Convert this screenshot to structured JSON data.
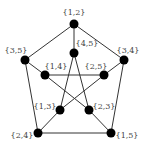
{
  "nodes": [
    {
      "id": "12",
      "label": "{1,2}",
      "x": 74,
      "y": 24,
      "lx": 74,
      "ly": 13,
      "anchor": "middle"
    },
    {
      "id": "35",
      "label": "{3,5}",
      "x": 25,
      "y": 60,
      "lx": 16,
      "ly": 51,
      "anchor": "middle"
    },
    {
      "id": "34",
      "label": "{3,4}",
      "x": 124,
      "y": 60,
      "lx": 128,
      "ly": 51,
      "anchor": "middle"
    },
    {
      "id": "45",
      "label": "{4,5}",
      "x": 74,
      "y": 53,
      "lx": 87,
      "ly": 44,
      "anchor": "middle"
    },
    {
      "id": "14",
      "label": "{1,4}",
      "x": 45,
      "y": 75,
      "lx": 56,
      "ly": 67,
      "anchor": "middle"
    },
    {
      "id": "25",
      "label": "{2,5}",
      "x": 104,
      "y": 75,
      "lx": 96,
      "ly": 67,
      "anchor": "middle"
    },
    {
      "id": "13",
      "label": "{1,3}",
      "x": 60,
      "y": 110,
      "lx": 45,
      "ly": 107,
      "anchor": "middle"
    },
    {
      "id": "23",
      "label": "{2,3}",
      "x": 89,
      "y": 110,
      "lx": 104,
      "ly": 107,
      "anchor": "middle"
    },
    {
      "id": "24",
      "label": "{2,4}",
      "x": 38,
      "y": 133,
      "lx": 22,
      "ly": 136,
      "anchor": "middle"
    },
    {
      "id": "15",
      "label": "{1,5}",
      "x": 111,
      "y": 133,
      "lx": 127,
      "ly": 136,
      "anchor": "middle"
    }
  ],
  "edges": [
    [
      "12",
      "35"
    ],
    [
      "12",
      "34"
    ],
    [
      "12",
      "45"
    ],
    [
      "35",
      "24"
    ],
    [
      "34",
      "15"
    ],
    [
      "24",
      "15"
    ],
    [
      "35",
      "14"
    ],
    [
      "34",
      "25"
    ],
    [
      "14",
      "25"
    ],
    [
      "45",
      "13"
    ],
    [
      "45",
      "23"
    ],
    [
      "14",
      "23"
    ],
    [
      "25",
      "13"
    ],
    [
      "13",
      "24"
    ],
    [
      "23",
      "15"
    ]
  ],
  "colors": {
    "node": "#000000",
    "edge": "#333333",
    "label": "#444444"
  }
}
